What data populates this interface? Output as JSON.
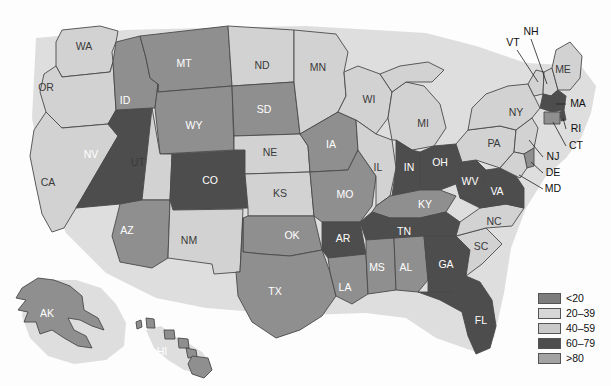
{
  "chart_data": {
    "type": "heatmap",
    "title": "",
    "subtitle": "",
    "map_region": "United States",
    "classification": "choropleth",
    "legend": {
      "position": "bottom-right",
      "entries": [
        {
          "label": "<20",
          "color": "#7d7d7d",
          "class_index": 0
        },
        {
          "label": "20–39",
          "color": "#d6d6d6",
          "class_index": 1
        },
        {
          "label": "40–59",
          "color": "#c9c9c9",
          "class_index": 2
        },
        {
          "label": "60–79",
          "color": "#4d4d4d",
          "class_index": 3
        },
        {
          "label": ">80",
          "color": "#a3a3a3",
          "class_index": 4
        }
      ]
    },
    "bin_colors": {
      "dark": "#4d4d4d",
      "medium": "#8f8f8f",
      "light": "#d2d2d2"
    },
    "categories": [
      "AL",
      "AK",
      "AZ",
      "AR",
      "CA",
      "CO",
      "CT",
      "DE",
      "FL",
      "GA",
      "HI",
      "ID",
      "IL",
      "IN",
      "IA",
      "KS",
      "KY",
      "LA",
      "ME",
      "MD",
      "MA",
      "MI",
      "MN",
      "MS",
      "MO",
      "MT",
      "NE",
      "NV",
      "NH",
      "NJ",
      "NM",
      "NY",
      "NC",
      "ND",
      "OH",
      "OK",
      "OR",
      "PA",
      "RI",
      "SC",
      "SD",
      "TN",
      "TX",
      "UT",
      "VT",
      "VA",
      "WA",
      "WV",
      "WI",
      "WY"
    ],
    "values": {
      "AL": "medium",
      "AK": "medium",
      "AZ": "medium",
      "AR": "dark",
      "CA": "light",
      "CO": "dark",
      "CT": "medium",
      "DE": "medium",
      "FL": "dark",
      "GA": "dark",
      "HI": "medium",
      "ID": "medium",
      "IL": "light",
      "IN": "dark",
      "IA": "medium",
      "KS": "light",
      "KY": "medium",
      "LA": "medium",
      "ME": "light",
      "MD": "light",
      "MA": "dark",
      "MI": "light",
      "MN": "light",
      "MS": "medium",
      "MO": "medium",
      "MT": "medium",
      "NE": "light",
      "NV": "dark",
      "NH": "light",
      "NJ": "light",
      "NM": "light",
      "NY": "light",
      "NC": "light",
      "ND": "light",
      "OH": "dark",
      "OK": "medium",
      "OR": "light",
      "PA": "light",
      "RI": "dark",
      "SC": "light",
      "SD": "medium",
      "TN": "dark",
      "TX": "medium",
      "UT": "light",
      "VT": "light",
      "VA": "dark",
      "WA": "light",
      "WV": "dark",
      "WI": "light",
      "WY": "medium"
    },
    "xlabel": "",
    "ylabel": "",
    "grid": false
  },
  "map": {
    "inset_labels": [
      {
        "code": "WA",
        "x": 84,
        "y": 47,
        "tone": "light"
      },
      {
        "code": "OR",
        "x": 46,
        "y": 88,
        "tone": "light"
      },
      {
        "code": "CA",
        "x": 48,
        "y": 183,
        "tone": "light"
      },
      {
        "code": "NV",
        "x": 91,
        "y": 155,
        "tone": "dark"
      },
      {
        "code": "ID",
        "x": 125,
        "y": 101,
        "tone": "medium"
      },
      {
        "code": "MT",
        "x": 184,
        "y": 64,
        "tone": "medium"
      },
      {
        "code": "WY",
        "x": 194,
        "y": 126,
        "tone": "medium"
      },
      {
        "code": "UT",
        "x": 138,
        "y": 163,
        "tone": "light"
      },
      {
        "code": "AZ",
        "x": 127,
        "y": 231,
        "tone": "medium"
      },
      {
        "code": "CO",
        "x": 210,
        "y": 181,
        "tone": "dark"
      },
      {
        "code": "NM",
        "x": 189,
        "y": 241,
        "tone": "light"
      },
      {
        "code": "ND",
        "x": 262,
        "y": 66,
        "tone": "light"
      },
      {
        "code": "SD",
        "x": 264,
        "y": 110,
        "tone": "medium"
      },
      {
        "code": "NE",
        "x": 270,
        "y": 153,
        "tone": "light"
      },
      {
        "code": "KS",
        "x": 280,
        "y": 194,
        "tone": "light"
      },
      {
        "code": "OK",
        "x": 292,
        "y": 236,
        "tone": "medium"
      },
      {
        "code": "TX",
        "x": 275,
        "y": 292,
        "tone": "medium"
      },
      {
        "code": "MN",
        "x": 318,
        "y": 68,
        "tone": "light"
      },
      {
        "code": "IA",
        "x": 331,
        "y": 145,
        "tone": "medium"
      },
      {
        "code": "MO",
        "x": 345,
        "y": 195,
        "tone": "medium"
      },
      {
        "code": "AR",
        "x": 343,
        "y": 239,
        "tone": "dark"
      },
      {
        "code": "LA",
        "x": 345,
        "y": 288,
        "tone": "medium"
      },
      {
        "code": "WI",
        "x": 369,
        "y": 100,
        "tone": "light"
      },
      {
        "code": "IL",
        "x": 378,
        "y": 168,
        "tone": "light"
      },
      {
        "code": "MS",
        "x": 377,
        "y": 268,
        "tone": "medium"
      },
      {
        "code": "MI",
        "x": 423,
        "y": 124,
        "tone": "light"
      },
      {
        "code": "IN",
        "x": 409,
        "y": 168,
        "tone": "dark"
      },
      {
        "code": "KY",
        "x": 425,
        "y": 205,
        "tone": "medium"
      },
      {
        "code": "TN",
        "x": 404,
        "y": 232,
        "tone": "dark"
      },
      {
        "code": "AL",
        "x": 406,
        "y": 268,
        "tone": "medium"
      },
      {
        "code": "OH",
        "x": 440,
        "y": 163,
        "tone": "dark"
      },
      {
        "code": "GA",
        "x": 446,
        "y": 265,
        "tone": "dark"
      },
      {
        "code": "FL",
        "x": 481,
        "y": 321,
        "tone": "dark"
      },
      {
        "code": "SC",
        "x": 481,
        "y": 247,
        "tone": "light"
      },
      {
        "code": "NC",
        "x": 494,
        "y": 222,
        "tone": "light"
      },
      {
        "code": "WV",
        "x": 470,
        "y": 182,
        "tone": "dark"
      },
      {
        "code": "VA",
        "x": 497,
        "y": 192,
        "tone": "dark"
      },
      {
        "code": "PA",
        "x": 494,
        "y": 144,
        "tone": "light"
      },
      {
        "code": "NY",
        "x": 516,
        "y": 113,
        "tone": "light"
      },
      {
        "code": "ME",
        "x": 563,
        "y": 70,
        "tone": "light"
      },
      {
        "code": "AK",
        "x": 47,
        "y": 314,
        "tone": "medium"
      },
      {
        "code": "HI",
        "x": 162,
        "y": 352,
        "tone": "medium"
      }
    ],
    "callout_labels": [
      {
        "code": "NH",
        "x": 531,
        "y": 32
      },
      {
        "code": "VT",
        "x": 513,
        "y": 43
      },
      {
        "code": "MA",
        "x": 578,
        "y": 104
      },
      {
        "code": "RI",
        "x": 576,
        "y": 129
      },
      {
        "code": "CT",
        "x": 576,
        "y": 146
      },
      {
        "code": "NJ",
        "x": 553,
        "y": 157
      },
      {
        "code": "DE",
        "x": 553,
        "y": 173
      },
      {
        "code": "MD",
        "x": 553,
        "y": 189
      }
    ]
  }
}
